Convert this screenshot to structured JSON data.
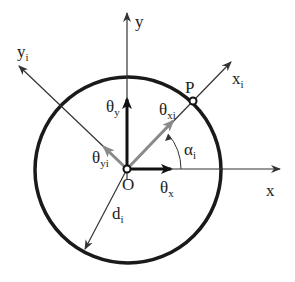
{
  "diagram": {
    "colors": {
      "circle": "#1a1a1a",
      "axes": "#333333",
      "bold_vectors": "#111111",
      "gray_vectors": "#8a8a8a",
      "background": "#ffffff"
    },
    "labels": {
      "y_axis": "y",
      "x_axis": "x",
      "xi_axis": {
        "base": "x",
        "sub": "i"
      },
      "yi_axis": {
        "base": "y",
        "sub": "i"
      },
      "point_P": "P",
      "origin": "O",
      "theta_y": {
        "base": "θ",
        "sub": "y"
      },
      "theta_x": {
        "base": "θ",
        "sub": "x"
      },
      "theta_xi": {
        "base": "θ",
        "sub": "xi"
      },
      "theta_yi": {
        "base": "θ",
        "sub": "yi"
      },
      "alpha_i": {
        "base": "α",
        "sub": "i"
      },
      "d_i": {
        "base": "d",
        "sub": "i"
      }
    }
  }
}
